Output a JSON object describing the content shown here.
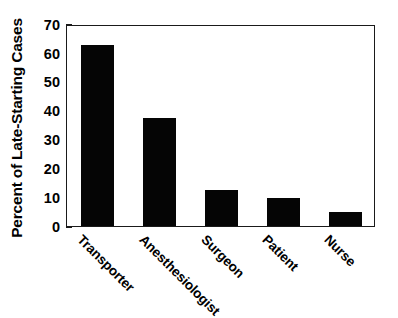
{
  "chart_data": {
    "type": "bar",
    "title": "",
    "subtitle": "",
    "xlabel": "",
    "ylabel": "Percent of Late-Starting Cases",
    "categories": [
      "Transporter",
      "Anesthesiologist",
      "Surgeon",
      "Patient",
      "Nurse"
    ],
    "values": [
      62.7,
      37.4,
      12.4,
      9.8,
      4.9
    ],
    "ylim": [
      0,
      70
    ],
    "ytick_labels": [
      "0",
      "10",
      "20",
      "30",
      "40",
      "50",
      "60",
      "70"
    ],
    "ytick_values": [
      0,
      10,
      20,
      30,
      40,
      50,
      60,
      70
    ],
    "grid": false,
    "legend": false,
    "legend_position": "none",
    "bar_color": "#050505",
    "axis_color": "#1a1a1a",
    "background_color": "#ffffff",
    "xtick_label_rotation": 45
  },
  "axes": {
    "y_title": "Percent of Late-Starting Cases"
  },
  "colors": {
    "bar": "#050505",
    "axis": "#1a1a1a",
    "background": "#ffffff",
    "text": "#000000"
  }
}
